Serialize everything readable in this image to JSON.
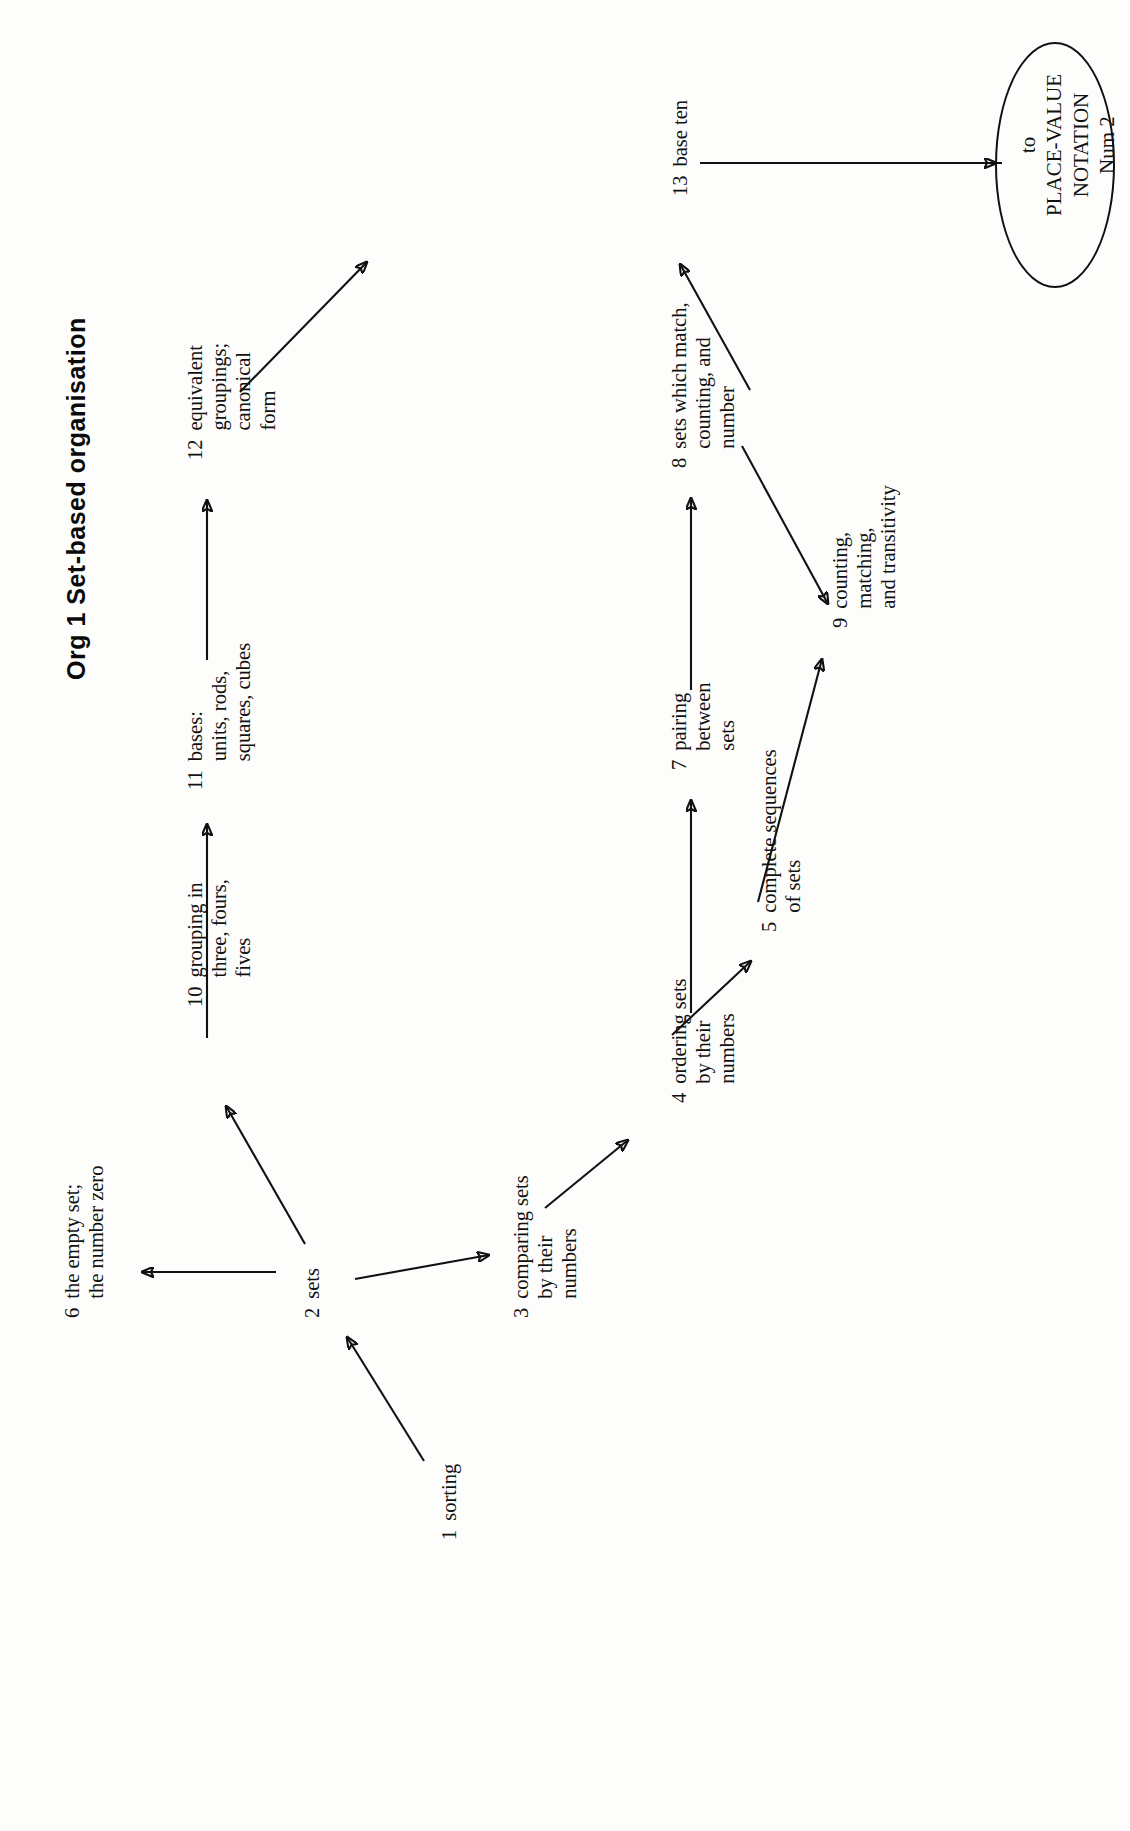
{
  "page": {
    "title": "Org 1  Set-based organisation",
    "orientation": "rotated-90-ccw",
    "background_color": "#fdfdfc",
    "ink_color": "#111111"
  },
  "terminal": {
    "name": "place-value-notation-terminal",
    "line1": "to",
    "line2": "PLACE-VALUE",
    "line3": "NOTATION",
    "line4": "Num 2"
  },
  "nodes": [
    {
      "id": "1",
      "num": "1",
      "text": "sorting"
    },
    {
      "id": "2",
      "num": "2",
      "text": "sets"
    },
    {
      "id": "3",
      "num": "3",
      "text": "comparing sets\nby their\nnumbers"
    },
    {
      "id": "4",
      "num": "4",
      "text": "ordering sets\nby their\nnumbers"
    },
    {
      "id": "5",
      "num": "5",
      "text": "complete sequences\nof sets"
    },
    {
      "id": "6",
      "num": "6",
      "text": "the empty set;\nthe number zero"
    },
    {
      "id": "7",
      "num": "7",
      "text": "pairing\nbetween\nsets"
    },
    {
      "id": "8",
      "num": "8",
      "text": "sets which match,\ncounting, and\nnumber"
    },
    {
      "id": "9",
      "num": "9",
      "text": "counting,\nmatching,\nand transitivity"
    },
    {
      "id": "10",
      "num": "10",
      "text": "grouping in\nthree, fours,\nfives"
    },
    {
      "id": "11",
      "num": "11",
      "text": "bases:\nunits, rods,\nsquares, cubes"
    },
    {
      "id": "12",
      "num": "12",
      "text": "equivalent\ngroupings;\ncanonical\nform"
    },
    {
      "id": "13",
      "num": "13",
      "text": "base ten"
    }
  ],
  "edges": [
    {
      "from": "1",
      "to": "2"
    },
    {
      "from": "2",
      "to": "6"
    },
    {
      "from": "2",
      "to": "10"
    },
    {
      "from": "2",
      "to": "3"
    },
    {
      "from": "3",
      "to": "4"
    },
    {
      "from": "4",
      "to": "5"
    },
    {
      "from": "4",
      "to": "7"
    },
    {
      "from": "5",
      "to": "9"
    },
    {
      "from": "7",
      "to": "8"
    },
    {
      "from": "8",
      "to": "9"
    },
    {
      "from": "8",
      "to": "13"
    },
    {
      "from": "10",
      "to": "11"
    },
    {
      "from": "11",
      "to": "12"
    },
    {
      "from": "12",
      "to": "13"
    },
    {
      "from": "13",
      "to": "place-value-notation-terminal"
    }
  ]
}
